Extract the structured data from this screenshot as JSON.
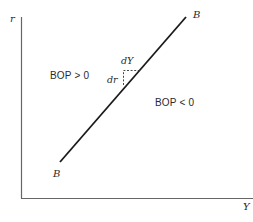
{
  "diagram": {
    "type": "BOP curve (IS-LM-BP style)",
    "axes": {
      "y_label": "r",
      "x_label": "Y"
    },
    "curve": {
      "name": "BB",
      "label_top": "B",
      "label_bottom": "B"
    },
    "regions": {
      "upper_left": "BOP > 0",
      "lower_right": "BOP < 0"
    },
    "slope_triangle": {
      "horizontal_label": "dY",
      "vertical_label": "dr"
    },
    "colors": {
      "line": "#1a1a1a",
      "axis": "#555555",
      "text": "#2a2a2a",
      "background": "#ffffff"
    }
  }
}
